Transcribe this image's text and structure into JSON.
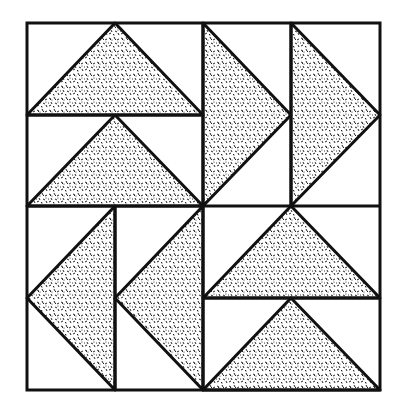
{
  "diagram": {
    "colors": {
      "background": "#ffffff",
      "line": "#111111",
      "fill_speckle": "#222222"
    },
    "bounds": {
      "left": 27,
      "top": 23,
      "right": 380,
      "bottom": 390
    },
    "quadrants": [
      {
        "id": "top-left",
        "orientation": "vertical-stack",
        "triangle_direction": "up",
        "units": 2
      },
      {
        "id": "top-right",
        "orientation": "horizontal-stack",
        "triangle_direction": "right",
        "units": 2
      },
      {
        "id": "bottom-left",
        "orientation": "horizontal-stack",
        "triangle_direction": "left",
        "units": 2
      },
      {
        "id": "bottom-right",
        "orientation": "vertical-stack",
        "triangle_direction": "up",
        "units": 2
      }
    ]
  }
}
